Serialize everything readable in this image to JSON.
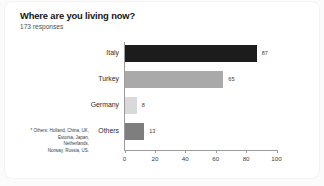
{
  "chart_data": {
    "type": "bar",
    "orientation": "horizontal",
    "title": "Where are you living now?",
    "subtitle": "173 responses",
    "categories": [
      "Italy",
      "Turkey",
      "Germany",
      "Others"
    ],
    "values": [
      87,
      65,
      8,
      13
    ],
    "value_labels": [
      "87",
      "65",
      "8",
      "13"
    ],
    "bar_colors": [
      "#1c1c1c",
      "#a9a9a9",
      "#d9d9d9",
      "#7e7e7e"
    ],
    "xlabel": "",
    "ylabel": "",
    "xlim": [
      0,
      100
    ],
    "xticks": [
      0,
      20,
      40,
      60,
      80,
      100
    ],
    "xtick_labels": [
      "0",
      "20",
      "40",
      "60",
      "80",
      "100"
    ],
    "grid": false,
    "legend": false,
    "axis_color": "#9b9b9b"
  },
  "footnote": {
    "lines": [
      "* Others: Holland, China, UK,",
      "Estonia, Japan,",
      "Netherlands,",
      "Norway, Russia, US."
    ]
  },
  "colors": {
    "page_background": "#fbfbfb",
    "card_background": "#ffffff",
    "title_color": "#141414",
    "subtitle_color": "#4e4e4e"
  }
}
